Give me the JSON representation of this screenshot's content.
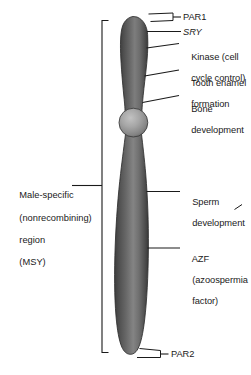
{
  "figure": {
    "organism_feature": "Y chromosome"
  },
  "chromosome": {
    "name": "y-chromosome",
    "arm_upper_name": "short-arm-Yp",
    "arm_lower_name": "long-arm-Yq",
    "centromere_name": "centromere",
    "colors": {
      "arm_dark": "#4e4e4e",
      "arm_mid": "#6e6e6e",
      "arm_light": "#9e9e9e",
      "arm_edge": "#3c3c3c",
      "centromere_light": "#b4b4b4",
      "centromere_dark": "#6a6a6a",
      "outline": "#2b2b2b",
      "line": "#1a1a1a",
      "background": "#ffffff"
    }
  },
  "region_bracket": {
    "name": "male-specific-region-bracket",
    "label_lines": [
      "Male-specific",
      "(nonrecombining)",
      "region",
      "(MSY)"
    ],
    "label_text": "Male-specific (nonrecombining) region (MSY)"
  },
  "annotations": [
    {
      "id": "par1",
      "lines": [
        "PAR1"
      ],
      "italic": false,
      "marker": "bracket"
    },
    {
      "id": "sry",
      "lines": [
        "SRY"
      ],
      "italic": true,
      "marker": "leader"
    },
    {
      "id": "kinase",
      "lines": [
        "Kinase (cell",
        "cycle control)"
      ],
      "italic": false,
      "marker": "leader"
    },
    {
      "id": "tooth-enamel",
      "lines": [
        "Tooth enamel",
        "formation"
      ],
      "italic": false,
      "marker": "leader"
    },
    {
      "id": "bone",
      "lines": [
        "Bone",
        "development"
      ],
      "italic": false,
      "marker": "leader"
    },
    {
      "id": "sperm",
      "lines": [
        "Sperm",
        "development"
      ],
      "italic": false,
      "marker": "leader"
    },
    {
      "id": "azf",
      "lines": [
        "AZF",
        "(azoospermia",
        "factor)"
      ],
      "italic": true,
      "italic_first_line_only": true,
      "marker": "leader"
    },
    {
      "id": "par2",
      "lines": [
        "PAR2"
      ],
      "italic": false,
      "marker": "bracket"
    }
  ],
  "label_text": {
    "par1": "PAR1",
    "sry": "SRY",
    "kinase_line1": "Kinase (cell",
    "kinase_line2": "cycle control)",
    "tooth_line1": "Tooth enamel",
    "tooth_line2": "formation",
    "bone_line1": "Bone",
    "bone_line2": "development",
    "sperm_line1": "Sperm",
    "sperm_line2": "development",
    "azf_line1": "AZF",
    "azf_line2": "(azoospermia",
    "azf_line3": "factor)",
    "par2": "PAR2",
    "msy_line1": "Male-specific",
    "msy_line2": "(nonrecombining)",
    "msy_line3": "region",
    "msy_line4": "(MSY)"
  }
}
